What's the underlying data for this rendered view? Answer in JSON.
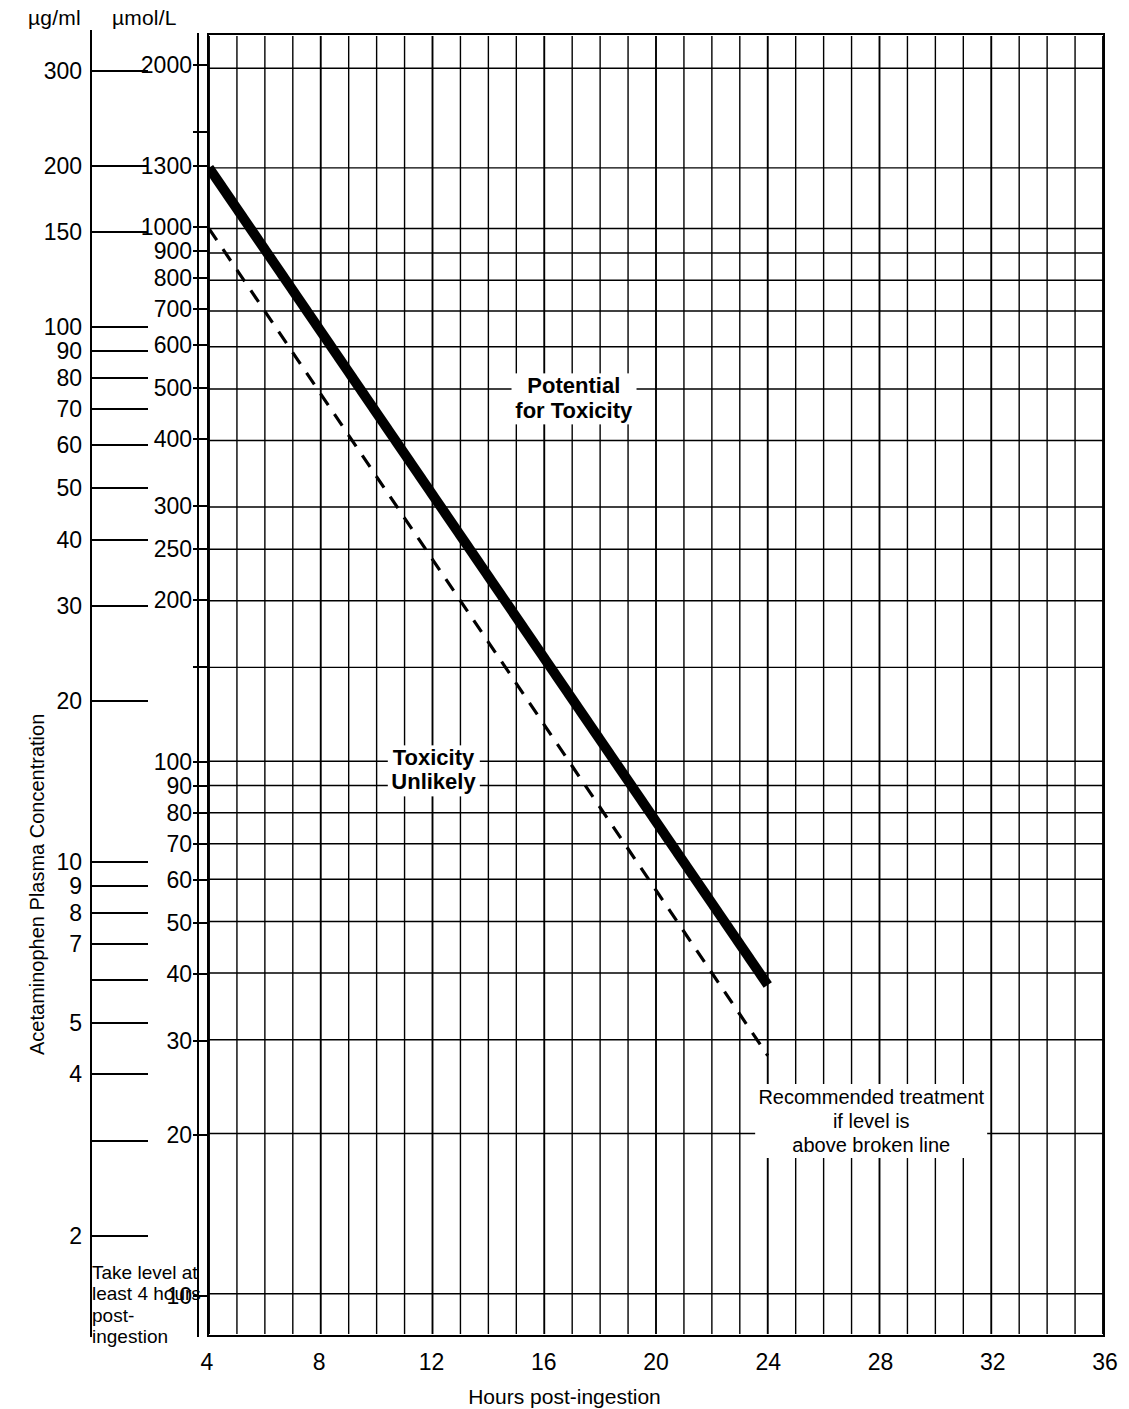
{
  "figure": {
    "y_axis_title": "Acetaminophen Plasma Concentration",
    "x_axis_title": "Hours post-ingestion",
    "unit_left_header": "µg/ml",
    "unit_right_header": "µmol/L"
  },
  "annotations": {
    "potential_toxicity_line1": "Potential",
    "potential_toxicity_line2": "for Toxicity",
    "toxicity_unlikely_line1": "Toxicity",
    "toxicity_unlikely_line2": "Unlikely",
    "treatment_line1": "Recommended treatment",
    "treatment_line2": "if level is",
    "treatment_line3": "above broken line",
    "corner_note": "Take level at\nleast 4 hours\npost-\ningestion"
  },
  "chart_data": {
    "type": "line",
    "xlabel": "Hours post-ingestion",
    "ylabel": "Acetaminophen Plasma Concentration",
    "xlim": [
      4,
      36
    ],
    "ylim_umol_per_L": [
      10,
      2000
    ],
    "ylim_ug_per_ml": [
      1.5,
      300
    ],
    "yscale": "log",
    "xscale": "linear",
    "grid": true,
    "legend": "none",
    "xticks": [
      4,
      8,
      12,
      16,
      20,
      24,
      28,
      32,
      36
    ],
    "xtick_labels": [
      "4",
      "8",
      "12",
      "16",
      "20",
      "24",
      "28",
      "32",
      "36"
    ],
    "x_minor_step": 1,
    "yticks_ug_per_ml": [
      {
        "value": 300,
        "label": "300"
      },
      {
        "value": 200,
        "label": "200"
      },
      {
        "value": 150,
        "label": "150"
      },
      {
        "value": 100,
        "label": "100"
      },
      {
        "value": 90,
        "label": "90"
      },
      {
        "value": 80,
        "label": "80"
      },
      {
        "value": 70,
        "label": "70"
      },
      {
        "value": 60,
        "label": "60"
      },
      {
        "value": 50,
        "label": "50"
      },
      {
        "value": 40,
        "label": "40"
      },
      {
        "value": 30,
        "label": "30"
      },
      {
        "value": 20,
        "label": "20"
      },
      {
        "value": 10,
        "label": "10"
      },
      {
        "value": 9,
        "label": "9"
      },
      {
        "value": 8,
        "label": "8"
      },
      {
        "value": 7,
        "label": "7"
      },
      {
        "value": 6,
        "label": ""
      },
      {
        "value": 5,
        "label": "5"
      },
      {
        "value": 4,
        "label": "4"
      },
      {
        "value": 3,
        "label": ""
      },
      {
        "value": 2,
        "label": "2"
      }
    ],
    "yticks_umol_per_L": [
      {
        "value": 2000,
        "label": "2000"
      },
      {
        "value": 1500,
        "label": ""
      },
      {
        "value": 1300,
        "label": "1300"
      },
      {
        "value": 1000,
        "label": "1000"
      },
      {
        "value": 900,
        "label": "900"
      },
      {
        "value": 800,
        "label": "800"
      },
      {
        "value": 700,
        "label": "700"
      },
      {
        "value": 600,
        "label": "600"
      },
      {
        "value": 500,
        "label": "500"
      },
      {
        "value": 400,
        "label": "400"
      },
      {
        "value": 300,
        "label": "300"
      },
      {
        "value": 250,
        "label": "250"
      },
      {
        "value": 200,
        "label": "200"
      },
      {
        "value": 150,
        "label": ""
      },
      {
        "value": 100,
        "label": "100"
      },
      {
        "value": 90,
        "label": "90"
      },
      {
        "value": 80,
        "label": "80"
      },
      {
        "value": 70,
        "label": "70"
      },
      {
        "value": 60,
        "label": "60"
      },
      {
        "value": 50,
        "label": "50"
      },
      {
        "value": 40,
        "label": "40"
      },
      {
        "value": 30,
        "label": "30"
      },
      {
        "value": 20,
        "label": "20"
      },
      {
        "value": 10,
        "label": "10"
      }
    ],
    "gridlines_umol_per_L": [
      2000,
      1300,
      1000,
      900,
      800,
      700,
      600,
      500,
      400,
      300,
      250,
      200,
      150,
      100,
      90,
      80,
      70,
      60,
      50,
      40,
      30,
      20,
      10
    ],
    "series": [
      {
        "name": "Probable hepatic toxicity (200 line)",
        "style": "solid-heavy",
        "color": "#000000",
        "points_umol_per_L": [
          [
            4,
            1300
          ],
          [
            24,
            38
          ]
        ],
        "points_ug_per_ml": [
          [
            4,
            200
          ],
          [
            24,
            6
          ]
        ]
      },
      {
        "name": "Treatment line / broken line (150 line)",
        "style": "dashed",
        "color": "#000000",
        "points_umol_per_L": [
          [
            4,
            1000
          ],
          [
            24,
            28
          ]
        ],
        "points_ug_per_ml": [
          [
            4,
            150
          ],
          [
            24,
            4.4
          ]
        ]
      }
    ],
    "regions": [
      {
        "label": "Potential for Toxicity",
        "position": "above solid line"
      },
      {
        "label": "Toxicity Unlikely",
        "position": "below solid line"
      }
    ]
  }
}
